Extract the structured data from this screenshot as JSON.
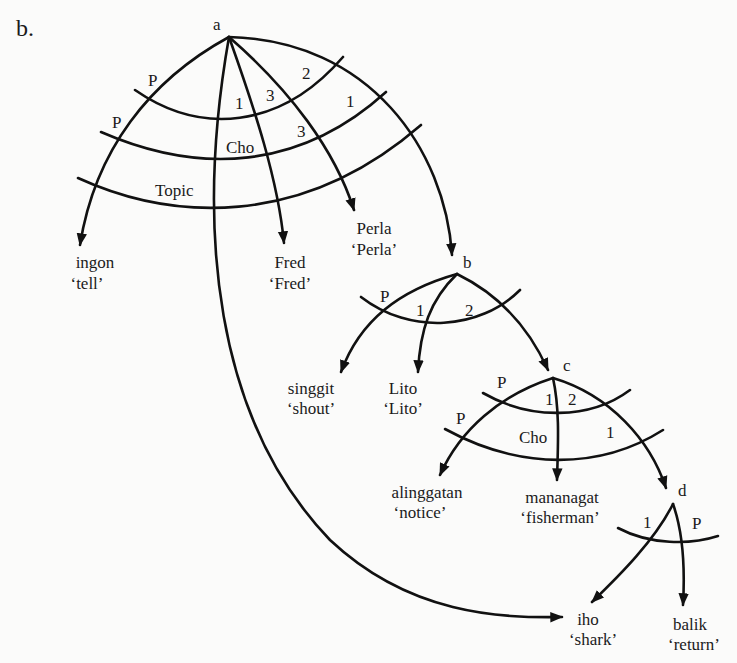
{
  "figure": {
    "label": "b."
  },
  "nodes": {
    "a": "a",
    "b": "b",
    "c": "c",
    "d": "d"
  },
  "arc_labels": {
    "a_P1": "P",
    "a_P2": "P",
    "a_1": "1",
    "a_3a": "3",
    "a_2": "2",
    "a_1b": "1",
    "a_3b": "3",
    "a_cho": "Cho",
    "a_topic": "Topic",
    "b_P": "P",
    "b_1": "1",
    "b_2": "2",
    "c_P1": "P",
    "c_P2": "P",
    "c_1": "1",
    "c_2": "2",
    "c_1b": "1",
    "c_cho": "Cho",
    "d_1": "1",
    "d_P": "P"
  },
  "leaves": {
    "ingon": {
      "word": "ingon",
      "gloss": "‘tell’"
    },
    "fred": {
      "word": "Fred",
      "gloss": "‘Fred’"
    },
    "perla": {
      "word": "Perla",
      "gloss": "‘Perla’"
    },
    "singgit": {
      "word": "singgit",
      "gloss": "‘shout’"
    },
    "lito": {
      "word": "Lito",
      "gloss": "‘Lito’"
    },
    "alinggatan": {
      "word": "alinggatan",
      "gloss": "‘notice’"
    },
    "mananagat": {
      "word": "mananagat",
      "gloss": "‘fisherman’"
    },
    "iho": {
      "word": "iho",
      "gloss": "‘shark’"
    },
    "balik": {
      "word": "balik",
      "gloss": "‘return’"
    }
  },
  "colors": {
    "ink": "#111111",
    "paper": "#fbfbfa"
  }
}
